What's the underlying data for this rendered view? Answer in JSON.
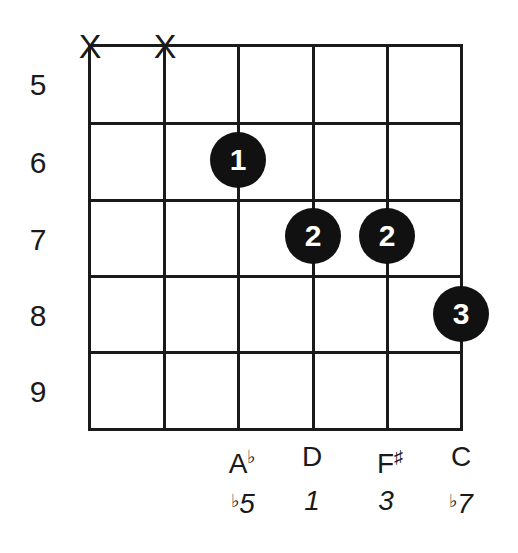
{
  "diagram": {
    "type": "guitar-chord-chart",
    "fret_labels": [
      "5",
      "6",
      "7",
      "8",
      "9"
    ],
    "strings_muted": [
      {
        "string": 6,
        "symbol": "X"
      },
      {
        "string": 5,
        "symbol": "X"
      }
    ],
    "fingers": [
      {
        "string": 4,
        "fret": 6,
        "finger": "1"
      },
      {
        "string": 3,
        "fret": 7,
        "finger": "2"
      },
      {
        "string": 2,
        "fret": 7,
        "finger": "2"
      },
      {
        "string": 1,
        "fret": 8,
        "finger": "3"
      }
    ],
    "notes": [
      {
        "string": 4,
        "name": "A",
        "accidental": "♭",
        "interval_prefix": "♭",
        "interval": "5"
      },
      {
        "string": 3,
        "name": "D",
        "accidental": "",
        "interval_prefix": "",
        "interval": "1"
      },
      {
        "string": 2,
        "name": "F",
        "accidental": "♯",
        "interval_prefix": "",
        "interval": "3"
      },
      {
        "string": 1,
        "name": "C",
        "accidental": "",
        "interval_prefix": "♭",
        "interval": "7"
      }
    ]
  }
}
